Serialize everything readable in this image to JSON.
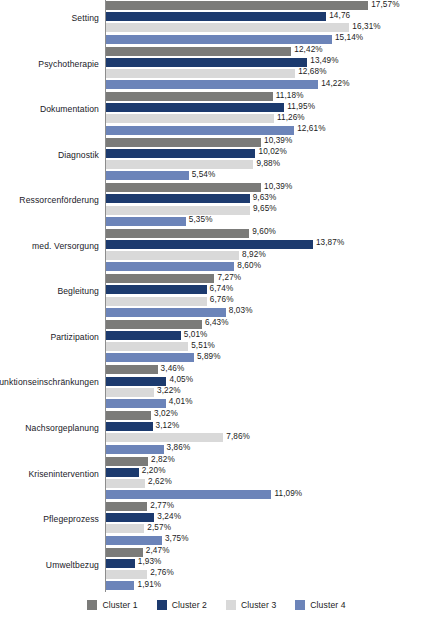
{
  "chart_data": {
    "type": "bar",
    "orientation": "horizontal",
    "title": "",
    "subtitle": "",
    "xlabel": "",
    "ylabel": "",
    "grid": false,
    "xlim": [
      0,
      17.57
    ],
    "value_suffix": "%",
    "decimal_separator": ",",
    "legend_position": "bottom",
    "categories": [
      "Setting",
      "Psychotherapie",
      "Dokumentation",
      "Diagnostik",
      "Ressorcenförderung",
      "med. Versorgung",
      "Begleitung",
      "Partizipation",
      "Funktionseinschränkungen",
      "Nachsorgeplanung",
      "Krisenintervention",
      "Pflegeprozess",
      "Umweltbezug"
    ],
    "series": [
      {
        "name": "Cluster 1",
        "color": "#7b7b79",
        "values": [
          17.57,
          12.42,
          11.18,
          10.39,
          10.39,
          9.6,
          7.27,
          6.43,
          3.46,
          3.02,
          2.82,
          2.77,
          2.47
        ],
        "labels": [
          "17,57%",
          "12,42%",
          "11,18%",
          "10,39%",
          "10,39%",
          "9,60%",
          "7,27%",
          "6,43%",
          "3,46%",
          "3,02%",
          "2,82%",
          "2,77%",
          "2,47%"
        ]
      },
      {
        "name": "Cluster 2",
        "color": "#1c3a6e",
        "values": [
          14.76,
          13.49,
          11.95,
          10.02,
          9.63,
          13.87,
          6.74,
          5.01,
          4.05,
          3.12,
          2.2,
          3.24,
          1.93
        ],
        "labels": [
          "14,76",
          "13,49%",
          "11,95%",
          "10,02%",
          "9,63%",
          "13,87%",
          "6,74%",
          "5,01%",
          "4,05%",
          "3,12%",
          "2,20%",
          "3,24%",
          "1,93%"
        ]
      },
      {
        "name": "Cluster 3",
        "color": "#d9d9d9",
        "values": [
          16.31,
          12.68,
          11.26,
          9.88,
          9.65,
          8.92,
          6.76,
          5.51,
          3.22,
          7.86,
          2.62,
          2.57,
          2.76
        ],
        "labels": [
          "16,31%",
          "12,68%",
          "11,26%",
          "9,88%",
          "9,65%",
          "8,92%",
          "6,76%",
          "5,51%",
          "3,22%",
          "7,86%",
          "2,62%",
          "2,57%",
          "2,76%"
        ]
      },
      {
        "name": "Cluster 4",
        "color": "#6c84b9",
        "values": [
          15.14,
          14.22,
          12.61,
          5.54,
          5.35,
          8.6,
          8.03,
          5.89,
          4.01,
          3.86,
          11.09,
          3.75,
          1.91
        ],
        "labels": [
          "15,14%",
          "14,22%",
          "12,61%",
          "5,54%",
          "5,35%",
          "8,60%",
          "8,03%",
          "5,89%",
          "4,01%",
          "3,86%",
          "11,09%",
          "3,75%",
          "1,91%"
        ]
      }
    ]
  },
  "legend": {
    "items": [
      {
        "label": "Cluster 1",
        "color": "#7b7b79"
      },
      {
        "label": "Cluster 2",
        "color": "#1c3a6e"
      },
      {
        "label": "Cluster 3",
        "color": "#d9d9d9"
      },
      {
        "label": "Cluster 4",
        "color": "#6c84b9"
      }
    ]
  }
}
